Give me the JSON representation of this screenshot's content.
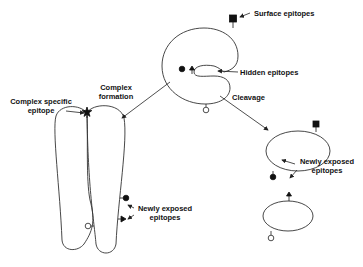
{
  "diagram": {
    "labels": {
      "surface_epitopes": "Surface epitopes",
      "hidden_epitopes": "Hidden epitopes",
      "cleavage": "Cleavage",
      "complex_formation_line1": "Complex",
      "complex_formation_line2": "formation",
      "complex_specific_line1": "Complex  specific",
      "complex_specific_line2": "epitope",
      "newly_exposed_right_line1": "Newly exposed",
      "newly_exposed_right_line2": "epitopes",
      "newly_exposed_left_line1": "Newly exposed",
      "newly_exposed_left_line2": "epitopes"
    },
    "colors": {
      "stroke": "#333333",
      "text": "#111111",
      "background": "#ffffff"
    },
    "legend_symbols": [
      "square-epitope",
      "circle-epitope",
      "triangle-epitope",
      "open-circle-epitope",
      "star-epitope"
    ]
  }
}
